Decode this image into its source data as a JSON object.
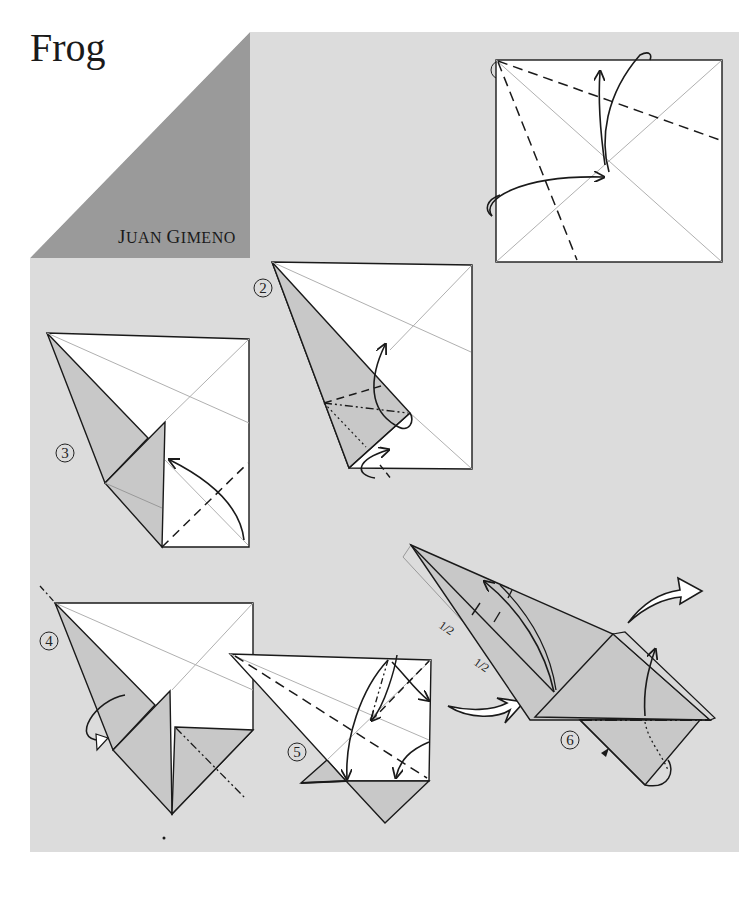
{
  "title": "Frog",
  "author": {
    "first_initial": "J",
    "first_rest": "UAN",
    "last_initial": "G",
    "last_rest": "IMENO",
    "full": "Juan Gimeno"
  },
  "colors": {
    "page_gray": "#dcdcdc",
    "corner_gray": "#9a9a9a",
    "paper_white": "#ffffff",
    "paper_shaded": "#c8c8c8",
    "line": "#1a1a1a",
    "crease": "#b0b0b0"
  },
  "steps": [
    {
      "number": "1",
      "description": "Square with diagonal creases; two valley folds from top-left corner; arrows indicating folds"
    },
    {
      "number": "2",
      "description": "Kite-like shape with shaded flap; valley, mountain and dotted fold lines; rotation arrows"
    },
    {
      "number": "3",
      "description": "Folded flap with valley fold on lower right; curved arrow"
    },
    {
      "number": "4",
      "description": "Shape with mountain fold axis line; turn-over arrow"
    },
    {
      "number": "5",
      "description": "Valley and mountain folds with multiple curved arrows"
    },
    {
      "number": "6",
      "description": "Narrow point with 1/2 markings; fold arrows and hollow turn arrows"
    }
  ],
  "labels": {
    "half_1": "1/2",
    "half_2": "1/2"
  }
}
